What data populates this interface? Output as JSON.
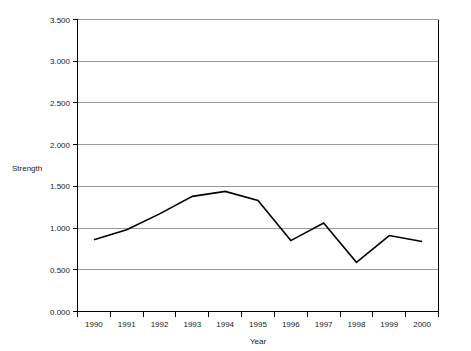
{
  "chart_data": {
    "type": "line",
    "title": "",
    "xlabel": "Year",
    "ylabel": "Strength",
    "categories": [
      "1990",
      "1991",
      "1992",
      "1993",
      "1994",
      "1995",
      "1996",
      "1997",
      "1998",
      "1999",
      "2000"
    ],
    "values": [
      0.86,
      0.98,
      1.17,
      1.38,
      1.44,
      1.33,
      0.85,
      1.06,
      0.59,
      0.91,
      0.84
    ],
    "series": [
      {
        "name": "Strength",
        "values": [
          0.86,
          0.98,
          1.17,
          1.38,
          1.44,
          1.33,
          0.85,
          1.06,
          0.59,
          0.91,
          0.84
        ]
      }
    ],
    "ylim": [
      0.0,
      3.5
    ],
    "ytick_values": [
      0.0,
      0.5,
      1.0,
      1.5,
      2.0,
      2.5,
      3.0,
      3.5
    ],
    "ytick_labels": [
      "0.000",
      "0.500",
      "1.000",
      "1.500",
      "2.000",
      "2.500",
      "3.000",
      "3.500"
    ],
    "grid": "horizontal",
    "legend": "none",
    "line_color": "#000000",
    "grid_color": "#9a9a9a",
    "axis_color": "#000000",
    "background_color": "#ffffff"
  }
}
